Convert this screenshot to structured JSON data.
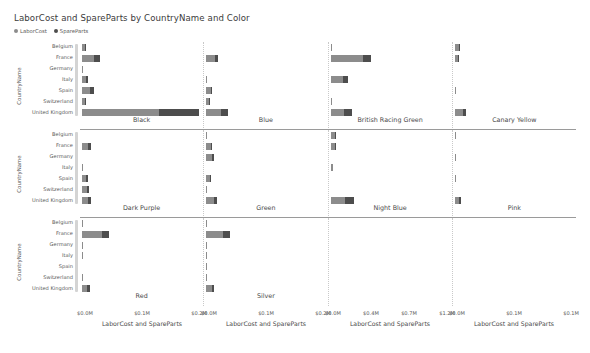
{
  "header": {
    "title": "LaborCost and SpareParts by CountryName and Color"
  },
  "legend": {
    "items": [
      {
        "label": "LaborCost",
        "color": "#8c8c8c",
        "icon": "legend-dot-icon"
      },
      {
        "label": "SpareParts",
        "color": "#4d4d4d",
        "icon": "legend-dot-icon"
      }
    ]
  },
  "axes": {
    "y_title": "CountryName",
    "x_title": "LaborCost and SpareParts",
    "categories": [
      "Belgium",
      "France",
      "Germany",
      "Italy",
      "Spain",
      "Switzerland",
      "United Kingdom"
    ]
  },
  "colors": {
    "labor": "#8c8c8c",
    "spare": "#4d4d4d",
    "rule": "#9a9a9a",
    "panel_divider": "#c9c9c9",
    "scrollbar": "#d4d4d4"
  },
  "x_axis_groups": [
    {
      "title": "LaborCost and SpareParts",
      "ticks": [
        "$0.0M",
        "$0.1M",
        "$0.2M"
      ]
    },
    {
      "title": "LaborCost and SpareParts",
      "ticks": [
        "$0.0M",
        "$0.1M",
        "$0.2M"
      ]
    },
    {
      "title": "LaborCost and SpareParts",
      "ticks": [
        "$0.0M",
        "$0.4M",
        "$0.7M",
        "$1.2M"
      ]
    },
    {
      "title": "LaborCost and SpareParts",
      "ticks": [
        "$0.0M",
        "$0.1M",
        "$0.1M"
      ]
    }
  ],
  "chart_data": {
    "type": "bar",
    "title": "LaborCost and SpareParts by CountryName and Color",
    "xlabel": "LaborCost and SpareParts",
    "ylabel": "CountryName",
    "orientation": "horizontal",
    "stacked": true,
    "grid": false,
    "legend_position": "top-left",
    "categories": [
      "Belgium",
      "France",
      "Germany",
      "Italy",
      "Spain",
      "Switzerland",
      "United Kingdom"
    ],
    "series_names": [
      "LaborCost",
      "SpareParts"
    ],
    "facet_rows": 3,
    "facet_cols": 4,
    "facets": [
      {
        "color": "Black",
        "row": 0,
        "col": 0,
        "xmax": 1.25,
        "labor": [
          0.03,
          0.125,
          0.008,
          0.045,
          0.085,
          0.028,
          0.8
        ],
        "spare": [
          0.01,
          0.06,
          0.0,
          0.012,
          0.035,
          0.008,
          0.42
        ]
      },
      {
        "color": "Blue",
        "row": 0,
        "col": 1,
        "xmax": 1.25,
        "labor": [
          0.0,
          0.085,
          0.0,
          0.012,
          0.045,
          0.03,
          0.15
        ],
        "spare": [
          0.0,
          0.03,
          0.0,
          0.0,
          0.01,
          0.01,
          0.07
        ]
      },
      {
        "color": "British Racing Green",
        "row": 0,
        "col": 2,
        "xmax": 1.25,
        "labor": [
          0.008,
          0.33,
          0.0,
          0.13,
          0.0,
          0.01,
          0.14
        ],
        "spare": [
          0.0,
          0.08,
          0.0,
          0.05,
          0.0,
          0.0,
          0.075
        ]
      },
      {
        "color": "Canary Yellow",
        "row": 0,
        "col": 3,
        "xmax": 1.25,
        "labor": [
          0.045,
          0.03,
          0.0,
          0.0,
          0.012,
          0.0,
          0.08
        ],
        "spare": [
          0.012,
          0.01,
          0.0,
          0.0,
          0.0,
          0.0,
          0.03
        ]
      },
      {
        "color": "Dark Purple",
        "row": 1,
        "col": 0,
        "xmax": 1.25,
        "labor": [
          0.0,
          0.065,
          0.0,
          0.012,
          0.045,
          0.055,
          0.065
        ],
        "spare": [
          0.0,
          0.022,
          0.0,
          0.0,
          0.012,
          0.02,
          0.022
        ]
      },
      {
        "color": "Green",
        "row": 1,
        "col": 1,
        "xmax": 1.25,
        "labor": [
          0.01,
          0.045,
          0.055,
          0.0,
          0.04,
          0.008,
          0.08
        ],
        "spare": [
          0.0,
          0.012,
          0.022,
          0.0,
          0.01,
          0.0,
          0.03
        ]
      },
      {
        "color": "Night Blue",
        "row": 1,
        "col": 2,
        "xmax": 1.25,
        "labor": [
          0.045,
          0.042,
          0.0,
          0.03,
          0.0,
          0.0,
          0.15
        ],
        "spare": [
          0.012,
          0.012,
          0.0,
          0.0,
          0.0,
          0.0,
          0.09
        ]
      },
      {
        "color": "Pink",
        "row": 1,
        "col": 3,
        "xmax": 1.25,
        "labor": [
          0.01,
          0.0,
          0.008,
          0.0,
          0.008,
          0.0,
          0.045
        ],
        "spare": [
          0.0,
          0.0,
          0.0,
          0.0,
          0.0,
          0.0,
          0.022
        ]
      },
      {
        "color": "Red",
        "row": 2,
        "col": 0,
        "xmax": 1.25,
        "labor": [
          0.01,
          0.2,
          0.008,
          0.008,
          0.0,
          0.01,
          0.055
        ],
        "spare": [
          0.0,
          0.075,
          0.0,
          0.0,
          0.0,
          0.0,
          0.03
        ]
      },
      {
        "color": "Silver",
        "row": 2,
        "col": 1,
        "xmax": 1.25,
        "labor": [
          0.01,
          0.17,
          0.01,
          0.01,
          0.01,
          0.01,
          0.055
        ],
        "spare": [
          0.0,
          0.07,
          0.0,
          0.0,
          0.0,
          0.0,
          0.028
        ]
      },
      {
        "color": "",
        "row": 2,
        "col": 2,
        "xmax": 1.25,
        "labor": [
          0.0,
          0.0,
          0.0,
          0.0,
          0.0,
          0.0,
          0.0
        ],
        "spare": [
          0.0,
          0.0,
          0.0,
          0.0,
          0.0,
          0.0,
          0.0
        ]
      },
      {
        "color": "",
        "row": 2,
        "col": 3,
        "xmax": 1.25,
        "labor": [
          0.0,
          0.0,
          0.0,
          0.0,
          0.0,
          0.0,
          0.0
        ],
        "spare": [
          0.0,
          0.0,
          0.0,
          0.0,
          0.0,
          0.0,
          0.0
        ]
      }
    ]
  }
}
